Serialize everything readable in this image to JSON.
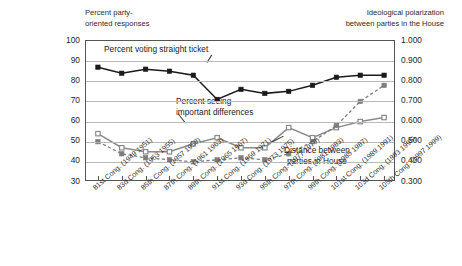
{
  "chart_data": {
    "type": "line",
    "title": "",
    "left_axis": {
      "label": "Percent party-oriented responses",
      "ticks": [
        "100",
        "90",
        "80",
        "70",
        "60",
        "50",
        "40",
        "30"
      ],
      "ylim": [
        30,
        100
      ]
    },
    "right_axis": {
      "label": "Ideological polarization between parties in the House",
      "ticks": [
        "1.000",
        "0.900",
        "0.800",
        "0.700",
        "0.600",
        "0.500",
        "0.400",
        "0.300"
      ],
      "ylim": [
        0.3,
        1.0
      ]
    },
    "xlabel": "",
    "grid": true,
    "legend_position": "in-plot annotations",
    "categories": [
      "81st Cong. (1949 1951)",
      "83d Cong. (1953 1955)",
      "85th Cong. (1957 1959)",
      "87th Cong. (1961 1963)",
      "89th Cong. (1965 1967)",
      "91st Cong. (1969 1971)",
      "93d Cong. (1973 1975)",
      "95th Cong. (1977 1979)",
      "97th Cong. (1981 1983)",
      "99th Cong. (1985 1987)",
      "101st Cong. (1989 1991)",
      "103d Cong. (1993 1995)",
      "105th Cong. (1997 1999)"
    ],
    "series": [
      {
        "name": "Percent voting straight ticket",
        "axis": "left",
        "marker": "filled-square",
        "line_style": "solid",
        "color": "#1a1a1a",
        "values": [
          87,
          84,
          86,
          85,
          83,
          71,
          76,
          74,
          75,
          78,
          82,
          83,
          83
        ]
      },
      {
        "name": "Percent seeing important differences",
        "axis": "left",
        "marker": "open-square",
        "line_style": "solid",
        "color": "#8a8a8a",
        "values": [
          54,
          47,
          45,
          45,
          49,
          52,
          47,
          47,
          57,
          52,
          57,
          60,
          62
        ]
      },
      {
        "name": "Distance between parties in House",
        "axis": "right",
        "marker": "filled-square-gray",
        "line_style": "dashed",
        "color": "#7d7d7d",
        "values": [
          0.5,
          0.44,
          0.42,
          0.41,
          0.4,
          0.41,
          0.42,
          0.41,
          0.44,
          0.5,
          0.58,
          0.7,
          0.78
        ]
      }
    ],
    "annotations": [
      {
        "name": "straight-ticket-annotation",
        "text": "Percent voting straight ticket"
      },
      {
        "name": "important-differences-annotation",
        "text": "Percent seeing\nimportant differences"
      },
      {
        "name": "distance-annotation",
        "text": "Distance between\nparties in House"
      }
    ]
  }
}
